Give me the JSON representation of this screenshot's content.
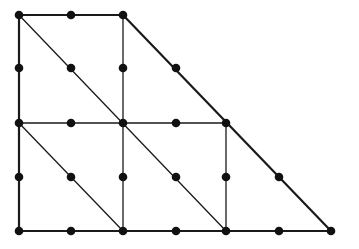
{
  "diagram": {
    "type": "graph",
    "colors": {
      "line": "#1a1a1a",
      "node": "#111111",
      "background": "#ffffff"
    },
    "nodes": [
      {
        "id": "a0",
        "x": 19,
        "y": 15
      },
      {
        "id": "a1",
        "x": 71,
        "y": 15
      },
      {
        "id": "a2",
        "x": 123,
        "y": 15
      },
      {
        "id": "b0",
        "x": 19,
        "y": 68
      },
      {
        "id": "b1",
        "x": 71,
        "y": 68
      },
      {
        "id": "b2",
        "x": 123,
        "y": 68
      },
      {
        "id": "b3",
        "x": 176,
        "y": 68
      },
      {
        "id": "c0",
        "x": 19,
        "y": 123
      },
      {
        "id": "c1",
        "x": 71,
        "y": 123
      },
      {
        "id": "c2",
        "x": 123,
        "y": 123
      },
      {
        "id": "c3",
        "x": 176,
        "y": 123
      },
      {
        "id": "c4",
        "x": 226,
        "y": 123
      },
      {
        "id": "d0",
        "x": 19,
        "y": 177
      },
      {
        "id": "d1",
        "x": 71,
        "y": 177
      },
      {
        "id": "d2",
        "x": 123,
        "y": 177
      },
      {
        "id": "d3",
        "x": 176,
        "y": 177
      },
      {
        "id": "d4",
        "x": 226,
        "y": 177
      },
      {
        "id": "d5",
        "x": 279,
        "y": 177
      },
      {
        "id": "e0",
        "x": 19,
        "y": 231
      },
      {
        "id": "e1",
        "x": 71,
        "y": 231
      },
      {
        "id": "e2",
        "x": 123,
        "y": 231
      },
      {
        "id": "e3",
        "x": 176,
        "y": 231
      },
      {
        "id": "e4",
        "x": 226,
        "y": 231
      },
      {
        "id": "e5",
        "x": 279,
        "y": 231
      },
      {
        "id": "e6",
        "x": 331,
        "y": 231
      }
    ],
    "edges": [
      {
        "name": "top-edge",
        "x1": 19,
        "y1": 15,
        "x2": 123,
        "y2": 15,
        "w": 2.2
      },
      {
        "name": "left-edge",
        "x1": 19,
        "y1": 15,
        "x2": 19,
        "y2": 231,
        "w": 2.2
      },
      {
        "name": "bottom-edge",
        "x1": 19,
        "y1": 231,
        "x2": 331,
        "y2": 231,
        "w": 2.2
      },
      {
        "name": "slanted-right-edge",
        "x1": 123,
        "y1": 15,
        "x2": 331,
        "y2": 231,
        "w": 2.2
      },
      {
        "name": "middle-horizontal",
        "x1": 19,
        "y1": 123,
        "x2": 226,
        "y2": 123,
        "w": 1.5
      },
      {
        "name": "vertical-x123",
        "x1": 123,
        "y1": 15,
        "x2": 123,
        "y2": 231,
        "w": 1.3
      },
      {
        "name": "vertical-x226",
        "x1": 226,
        "y1": 123,
        "x2": 226,
        "y2": 231,
        "w": 1.3
      },
      {
        "name": "main-diagonal",
        "x1": 19,
        "y1": 15,
        "x2": 226,
        "y2": 231,
        "w": 1.3
      },
      {
        "name": "lower-diagonal",
        "x1": 19,
        "y1": 123,
        "x2": 123,
        "y2": 231,
        "w": 1.3
      }
    ],
    "node_radius": 4.3
  }
}
